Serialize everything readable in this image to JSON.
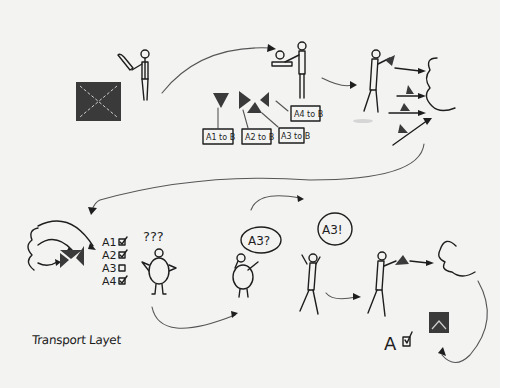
{
  "diagram": {
    "caption": "Transport Layet",
    "colors": {
      "paper": "#f3f3f2",
      "ink": "#1e1e1e",
      "packet_fill": "#3a3a3a"
    },
    "stages": [
      {
        "id": 1,
        "description": "Person cuts a large data block (envelope) with a knife"
      },
      {
        "id": 2,
        "description": "Person stamps segments; four triangular segments labeled with addresses"
      },
      {
        "id": 3,
        "description": "Person throws segments into the network cloud"
      },
      {
        "id": 4,
        "description": "Segments arrive from cloud and are reassembled with checklist"
      },
      {
        "id": 5,
        "description": "Confused receiver notices missing segment"
      },
      {
        "id": 6,
        "description": "Receiver phones sender asking for A3"
      },
      {
        "id": 7,
        "description": "Sender resends A3 into cloud; data reassembled with confirmation"
      }
    ],
    "segment_labels": [
      "A1 to B",
      "A2 to B",
      "A3 to B",
      "A4 to B"
    ],
    "checklist": [
      {
        "label": "A1",
        "checked": true
      },
      {
        "label": "A2",
        "checked": true
      },
      {
        "label": "A3",
        "checked": false
      },
      {
        "label": "A4",
        "checked": true
      }
    ],
    "confusion_marks": "???",
    "speech_request": "A3?",
    "speech_response": "A3!",
    "final_label": "A",
    "final_checked": true
  }
}
